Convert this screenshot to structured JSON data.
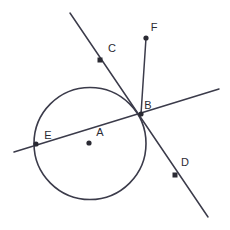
{
  "figure": {
    "width": 230,
    "height": 230,
    "background_color": "#ffffff",
    "stroke_color": "#3b3b4a",
    "point_color": "#2a2a33",
    "label_color": "#2b2b33"
  },
  "circle": {
    "name": "circle-A",
    "center_x": 90,
    "center_y": 143.5,
    "radius": 56
  },
  "points": [
    {
      "id": "A",
      "label": "A",
      "marker": "dot",
      "x": 89,
      "y": 143,
      "label_x": 100,
      "label_y": 133,
      "role": "circle-center"
    },
    {
      "id": "B",
      "label": "B",
      "marker": "dot",
      "x": 141,
      "y": 114,
      "label_x": 148,
      "label_y": 106,
      "role": "intersection-on-circle"
    },
    {
      "id": "C",
      "label": "C",
      "marker": "square",
      "x": 100,
      "y": 60,
      "label_x": 112,
      "label_y": 49,
      "role": "point-on-line-cd"
    },
    {
      "id": "D",
      "label": "D",
      "marker": "square",
      "x": 175,
      "y": 175,
      "label_x": 185,
      "label_y": 163,
      "role": "point-on-line-cd"
    },
    {
      "id": "E",
      "label": "E",
      "marker": "dot",
      "x": 36,
      "y": 144,
      "label_x": 48,
      "label_y": 136,
      "role": "point-on-secant"
    },
    {
      "id": "F",
      "label": "F",
      "marker": "dot",
      "x": 146,
      "y": 38,
      "label_x": 154,
      "label_y": 28,
      "role": "endpoint-of-segment-bf"
    }
  ],
  "lines": [
    {
      "id": "line-CD",
      "name": "line-through-c-and-d",
      "x1": 70,
      "y1": 13,
      "x2": 208,
      "y2": 217
    },
    {
      "id": "line-EB",
      "name": "secant-line-through-e-and-b",
      "x1": 14,
      "y1": 152,
      "x2": 219,
      "y2": 89
    },
    {
      "id": "segment-BF",
      "name": "segment-b-to-f",
      "x1": 141,
      "y1": 114,
      "x2": 146,
      "y2": 38
    }
  ]
}
